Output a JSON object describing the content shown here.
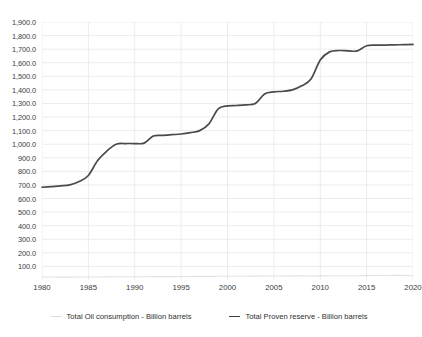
{
  "chart_data": {
    "type": "line",
    "title": "",
    "subtitle": "",
    "xlabel": "",
    "ylabel": "",
    "xlim": [
      1980,
      2020
    ],
    "ylim": [
      0,
      1900
    ],
    "grid": true,
    "legend_position": "bottom-center",
    "x_ticks": [
      "1980",
      "1985",
      "1990",
      "1995",
      "2000",
      "2005",
      "2010",
      "2015",
      "2020"
    ],
    "x_tick_values": [
      1980,
      1985,
      1990,
      1995,
      2000,
      2005,
      2010,
      2015,
      2020
    ],
    "y_ticks": [
      "100.0",
      "200.0",
      "300.0",
      "400.0",
      "500.0",
      "600.0",
      "700.0",
      "800.0",
      "900.0",
      "1,000.0",
      "1,100.0",
      "1,200.0",
      "1,300.0",
      "1,400.0",
      "1,500.0",
      "1,600.0",
      "1,700.0",
      "1,800.0",
      "1,900.0"
    ],
    "y_tick_values": [
      100,
      200,
      300,
      400,
      500,
      600,
      700,
      800,
      900,
      1000,
      1100,
      1200,
      1300,
      1400,
      1500,
      1600,
      1700,
      1800,
      1900
    ],
    "x": [
      1980,
      1981,
      1982,
      1983,
      1984,
      1985,
      1986,
      1987,
      1988,
      1989,
      1990,
      1991,
      1992,
      1993,
      1994,
      1995,
      1996,
      1997,
      1998,
      1999,
      2000,
      2001,
      2002,
      2003,
      2004,
      2005,
      2006,
      2007,
      2008,
      2009,
      2010,
      2011,
      2012,
      2013,
      2014,
      2015,
      2016,
      2017,
      2018,
      2019,
      2020
    ],
    "series": [
      {
        "name": "Total Oil consumption - Billion barrels",
        "color": "#e2e2e2",
        "values": [
          22.5,
          21.8,
          21.3,
          21.2,
          21.6,
          21.8,
          22.5,
          23.0,
          23.6,
          24.0,
          24.2,
          24.3,
          24.5,
          24.5,
          24.9,
          25.3,
          25.9,
          26.4,
          26.6,
          27.1,
          27.4,
          27.6,
          27.6,
          28.2,
          29.2,
          29.6,
          29.9,
          30.2,
          30.1,
          29.7,
          30.5,
          30.8,
          31.1,
          31.4,
          31.8,
          32.4,
          32.9,
          33.3,
          33.7,
          33.8,
          31.0
        ]
      },
      {
        "name": "Total Proven reserve - Billion barrels",
        "color": "#4a4a4a",
        "values": [
          683,
          688,
          693,
          700,
          725,
          770,
          880,
          950,
          1000,
          1005,
          1005,
          1008,
          1060,
          1065,
          1070,
          1075,
          1085,
          1100,
          1150,
          1260,
          1282,
          1285,
          1290,
          1300,
          1370,
          1385,
          1390,
          1400,
          1430,
          1480,
          1620,
          1680,
          1690,
          1688,
          1687,
          1725,
          1730,
          1730,
          1732,
          1733,
          1735
        ]
      }
    ]
  },
  "legend": {
    "items": [
      {
        "label": "Total Oil consumption - Billion barrels",
        "color": "#dcdcdc"
      },
      {
        "label": "Total Proven reserve - Billion barrels",
        "color": "#3f3f3f"
      }
    ]
  },
  "style": {
    "background": "#ffffff",
    "grid_color": "#ececec",
    "axis_text_color": "#3c3c3c"
  }
}
